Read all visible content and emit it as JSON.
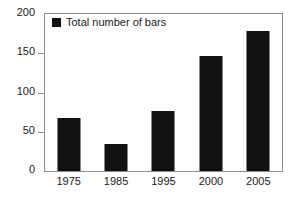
{
  "chart_data": {
    "type": "bar",
    "title": "",
    "subtitle": "",
    "xlabel": "",
    "ylabel": "",
    "categories": [
      "1975",
      "1985",
      "1995",
      "2000",
      "2005"
    ],
    "values": [
      67,
      35,
      77,
      146,
      178
    ],
    "series": [
      {
        "name": "Total number of bars",
        "values": [
          67,
          35,
          77,
          146,
          178
        ],
        "color": "#111111"
      }
    ],
    "ylim": [
      0,
      200
    ],
    "yticks": [
      0,
      50,
      100,
      150,
      200
    ],
    "ytick_labels": [
      "0",
      "50",
      "100",
      "150",
      "200"
    ],
    "grid": false,
    "legend": {
      "position": "top-left-inside",
      "entries": [
        {
          "label": "Total number of bars",
          "marker": "square",
          "color": "#111111"
        }
      ]
    },
    "frame_color": "#8c8c8c",
    "background": "#ffffff"
  }
}
